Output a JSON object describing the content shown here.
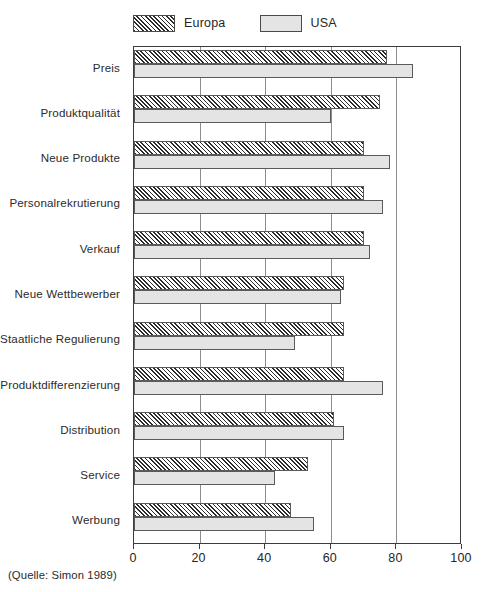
{
  "legend": {
    "position": "top-left",
    "entries": [
      {
        "label": "Europa",
        "style": "hatched",
        "color": "#2b2b2b"
      },
      {
        "label": "USA",
        "style": "solid",
        "color": "#e4e4e4"
      }
    ]
  },
  "source_note": "(Quelle: Simon 1989)",
  "axis": {
    "x_ticks": [
      "0",
      "20",
      "40",
      "60",
      "80",
      "100"
    ]
  },
  "chart_data": {
    "type": "bar",
    "orientation": "horizontal",
    "title": "",
    "subtitle": "",
    "xlabel": "",
    "ylabel": "",
    "xlim": [
      0,
      100
    ],
    "xticks": [
      0,
      20,
      40,
      60,
      80,
      100
    ],
    "grid": true,
    "legend_position": "top-left",
    "categories": [
      "Preis",
      "Produktqualität",
      "Neue Produkte",
      "Personalrekrutierung",
      "Verkauf",
      "Neue Wettbewerber",
      "Staatliche Regulierung",
      "Produktdifferenzierung",
      "Distribution",
      "Service",
      "Werbung"
    ],
    "series": [
      {
        "name": "Europa",
        "values": [
          77,
          75,
          70,
          70,
          70,
          64,
          64,
          64,
          61,
          53,
          48
        ]
      },
      {
        "name": "USA",
        "values": [
          85,
          60,
          78,
          76,
          72,
          63,
          49,
          76,
          64,
          43,
          55
        ]
      }
    ]
  }
}
